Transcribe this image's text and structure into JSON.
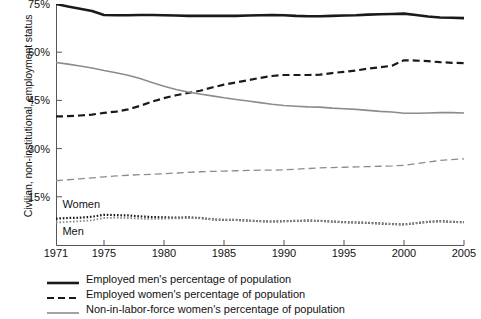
{
  "chart_data": {
    "type": "line",
    "title": "",
    "xlabel": "",
    "ylabel": "Civilian, non-institutional, employment status",
    "xlim": [
      1971,
      2005
    ],
    "ylim": [
      0,
      75
    ],
    "yticks": [
      "15%",
      "30%",
      "45%",
      "60%",
      "75%"
    ],
    "ytick_values": [
      15,
      30,
      45,
      60,
      75
    ],
    "xticks": [
      "1971",
      "1975",
      "1980",
      "1985",
      "1990",
      "1995",
      "2000",
      "2005"
    ],
    "xtick_values": [
      1971,
      1975,
      1980,
      1985,
      1990,
      1995,
      2000,
      2005
    ],
    "grid": false,
    "legend_position": "below",
    "x": [
      1971,
      1972,
      1973,
      1974,
      1975,
      1976,
      1977,
      1978,
      1979,
      1980,
      1981,
      1982,
      1983,
      1984,
      1985,
      1986,
      1987,
      1988,
      1989,
      1990,
      1991,
      1992,
      1993,
      1994,
      1995,
      1996,
      1997,
      1998,
      1999,
      2000,
      2001,
      2002,
      2003,
      2004,
      2005
    ],
    "series": [
      {
        "name": "Employed men's percentage of population",
        "style": "solid",
        "color": "#1a1a1a",
        "width": 2.6,
        "values": [
          75.0,
          74.2,
          73.5,
          72.8,
          71.6,
          71.5,
          71.5,
          71.6,
          71.6,
          71.5,
          71.4,
          71.3,
          71.3,
          71.3,
          71.3,
          71.3,
          71.4,
          71.5,
          71.6,
          71.5,
          71.3,
          71.2,
          71.2,
          71.3,
          71.4,
          71.5,
          71.7,
          71.8,
          71.9,
          72.0,
          71.6,
          71.1,
          70.8,
          70.7,
          70.6
        ]
      },
      {
        "name": "Employed women's percentage of population",
        "style": "dashed",
        "color": "#1a1a1a",
        "width": 2.2,
        "values": [
          40.0,
          40.1,
          40.3,
          40.6,
          41.1,
          41.5,
          42.2,
          43.3,
          44.6,
          45.7,
          46.6,
          47.3,
          48.0,
          49.0,
          49.9,
          50.6,
          51.3,
          52.0,
          52.6,
          52.9,
          52.9,
          52.9,
          53.0,
          53.5,
          53.9,
          54.3,
          54.9,
          55.3,
          55.8,
          57.5,
          57.4,
          57.2,
          56.9,
          56.7,
          56.6
        ]
      },
      {
        "name": "Non-in-labor-force women's percentage of population",
        "style": "solid",
        "color": "#8c8c8c",
        "width": 1.6,
        "values": [
          56.8,
          56.3,
          55.7,
          55.1,
          54.3,
          53.6,
          52.8,
          51.8,
          50.6,
          49.4,
          48.4,
          47.6,
          47.0,
          46.4,
          45.8,
          45.3,
          44.8,
          44.3,
          43.8,
          43.4,
          43.2,
          43.0,
          42.9,
          42.6,
          42.4,
          42.2,
          41.9,
          41.6,
          41.4,
          41.0,
          41.0,
          41.1,
          41.2,
          41.2,
          41.1
        ]
      },
      {
        "name": "non-in-labor-force-men",
        "style": "dashed",
        "color": "#8c8c8c",
        "width": 1.3,
        "values": [
          20.0,
          20.3,
          20.6,
          20.9,
          21.2,
          21.5,
          21.7,
          21.9,
          22.0,
          22.2,
          22.4,
          22.6,
          22.8,
          22.9,
          23.0,
          23.1,
          23.2,
          23.3,
          23.3,
          23.4,
          23.6,
          23.8,
          24.0,
          24.1,
          24.2,
          24.3,
          24.4,
          24.5,
          24.6,
          24.8,
          25.3,
          25.8,
          26.3,
          26.6,
          26.8
        ]
      },
      {
        "name": "unemployed-women",
        "style": "dotted",
        "color": "#1a1a1a",
        "width": 2.2,
        "values": [
          8.2,
          8.4,
          8.5,
          8.8,
          9.4,
          9.3,
          9.2,
          8.9,
          8.7,
          8.6,
          8.5,
          8.6,
          8.4,
          8.0,
          7.8,
          7.8,
          7.6,
          7.4,
          7.3,
          7.4,
          7.5,
          7.6,
          7.5,
          7.3,
          7.1,
          7.0,
          6.9,
          6.7,
          6.5,
          6.4,
          6.8,
          7.2,
          7.4,
          7.2,
          7.1
        ]
      },
      {
        "name": "unemployed-men",
        "style": "dotted",
        "color": "#8c8c8c",
        "width": 1.8,
        "values": [
          7.0,
          7.2,
          7.4,
          7.7,
          8.4,
          8.5,
          8.4,
          8.2,
          8.1,
          8.2,
          8.3,
          8.4,
          8.3,
          8.0,
          7.8,
          7.8,
          7.6,
          7.4,
          7.3,
          7.4,
          7.5,
          7.6,
          7.5,
          7.3,
          7.1,
          7.0,
          6.9,
          6.7,
          6.5,
          6.4,
          6.8,
          7.2,
          7.4,
          7.2,
          7.1
        ]
      }
    ],
    "annotations": [
      {
        "text": "Women",
        "x": 1971.2,
        "y": 12.5
      },
      {
        "text": "Men",
        "x": 1971.2,
        "y": 4.0
      }
    ],
    "legend": [
      {
        "label": "Employed men's percentage of population",
        "style": "solid",
        "color": "#1a1a1a",
        "width": 2.6
      },
      {
        "label": "Employed women's percentage of population",
        "style": "dashed",
        "color": "#1a1a1a",
        "width": 2.2
      },
      {
        "label": "Non-in-labor-force women's percentage of population",
        "style": "solid",
        "color": "#8c8c8c",
        "width": 1.6
      }
    ]
  }
}
